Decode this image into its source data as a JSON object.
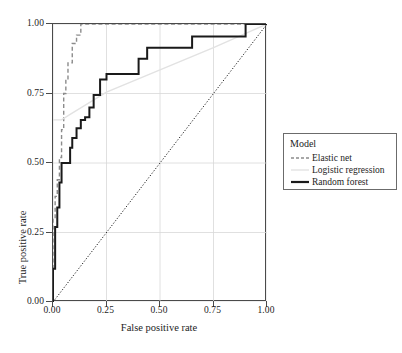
{
  "chart_data": {
    "type": "line",
    "title": "",
    "xlabel": "False positive rate",
    "ylabel": "True positive rate",
    "xlim": [
      0.0,
      1.0
    ],
    "ylim": [
      0.0,
      1.0
    ],
    "xticks": [
      "0.00",
      "0.25",
      "0.50",
      "0.75",
      "1.00"
    ],
    "xtick_values": [
      0.0,
      0.25,
      0.5,
      0.75,
      1.0
    ],
    "yticks": [
      "0.00",
      "0.25",
      "0.50",
      "0.75",
      "1.00"
    ],
    "ytick_values": [
      0.0,
      0.25,
      0.5,
      0.75,
      1.0
    ],
    "grid": true,
    "grid_color": "#d8d8d8",
    "legend_position": "right",
    "reference_line": {
      "name": "chance-diagonal",
      "style": "dotted",
      "color": "#1a1a1a",
      "x": [
        0.0,
        1.0
      ],
      "y": [
        0.0,
        1.0
      ]
    },
    "series": [
      {
        "name": "Elastic net",
        "color": "#8c8c8c",
        "style": "dashed",
        "width": 1.4,
        "x": [
          0.0,
          0.0,
          0.01,
          0.01,
          0.02,
          0.02,
          0.03,
          0.03,
          0.04,
          0.04,
          0.05,
          0.05,
          0.06,
          0.06,
          0.07,
          0.07,
          0.09,
          0.09,
          0.11,
          0.11,
          0.13,
          0.13,
          1.0
        ],
        "y": [
          0.0,
          0.3,
          0.3,
          0.38,
          0.38,
          0.44,
          0.44,
          0.52,
          0.52,
          0.62,
          0.62,
          0.75,
          0.75,
          0.8,
          0.8,
          0.86,
          0.86,
          0.93,
          0.93,
          0.96,
          0.96,
          1.0,
          1.0
        ]
      },
      {
        "name": "Logistic regression",
        "color": "#e2e2e2",
        "style": "solid",
        "width": 1.4,
        "x": [
          0.0,
          0.04,
          0.08,
          0.25,
          0.5,
          0.75,
          1.0
        ],
        "y": [
          0.655,
          0.655,
          0.675,
          0.755,
          0.835,
          0.915,
          1.0
        ]
      },
      {
        "name": "Random forest",
        "color": "#1a1a1a",
        "style": "solid",
        "width": 2.0,
        "x": [
          0.0,
          0.0,
          0.01,
          0.01,
          0.02,
          0.02,
          0.03,
          0.03,
          0.04,
          0.04,
          0.06,
          0.06,
          0.08,
          0.08,
          0.09,
          0.09,
          0.11,
          0.11,
          0.13,
          0.13,
          0.15,
          0.15,
          0.17,
          0.17,
          0.19,
          0.19,
          0.22,
          0.22,
          0.25,
          0.25,
          0.29,
          0.29,
          0.4,
          0.4,
          0.44,
          0.44,
          0.65,
          0.65,
          0.9,
          0.9,
          0.97,
          0.97,
          1.0
        ],
        "y": [
          0.0,
          0.12,
          0.12,
          0.27,
          0.27,
          0.34,
          0.34,
          0.43,
          0.43,
          0.5,
          0.5,
          0.5,
          0.5,
          0.555,
          0.555,
          0.59,
          0.59,
          0.625,
          0.625,
          0.655,
          0.655,
          0.665,
          0.665,
          0.7,
          0.7,
          0.745,
          0.745,
          0.8,
          0.8,
          0.82,
          0.82,
          0.82,
          0.82,
          0.875,
          0.875,
          0.915,
          0.915,
          0.955,
          0.955,
          1.0,
          1.0,
          1.0,
          1.0
        ]
      }
    ]
  },
  "legend": {
    "title": "Model",
    "entries": [
      {
        "label": "Elastic net",
        "color": "#8c8c8c",
        "style": "dashed",
        "width": 1.4
      },
      {
        "label": "Logistic regression",
        "color": "#e2e2e2",
        "style": "solid",
        "width": 1.4
      },
      {
        "label": "Random forest",
        "color": "#1a1a1a",
        "style": "solid",
        "width": 2.2
      }
    ]
  }
}
